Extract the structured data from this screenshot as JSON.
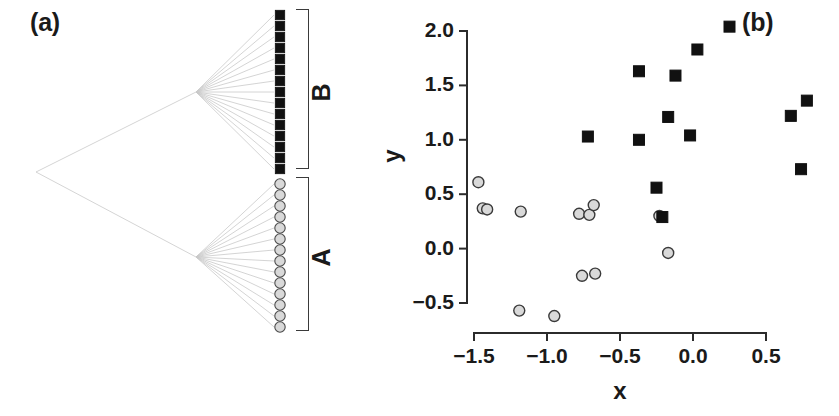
{
  "figure": {
    "width": 839,
    "height": 416,
    "background": "#ffffff"
  },
  "panels": {
    "a": {
      "label": "(a)",
      "description": "phylogenetic-tree",
      "clades": [
        {
          "name": "B",
          "tip_symbol": "filled-square",
          "tip_count": 15,
          "color": "#111111"
        },
        {
          "name": "A",
          "tip_symbol": "open-circle",
          "tip_count": 14,
          "color": "#d9d9d9"
        }
      ],
      "tree_color": "#c9c9c9"
    },
    "b": {
      "label": "(b)"
    }
  },
  "chart_data": {
    "type": "scatter",
    "title": "",
    "xlabel": "x",
    "ylabel": "y",
    "xlim": [
      -1.6,
      0.9
    ],
    "ylim": [
      -0.72,
      2.12
    ],
    "xticks": [
      -1.5,
      -1.0,
      -0.5,
      0.0,
      0.5
    ],
    "xticklabels": [
      "−1.5",
      "−1.0",
      "−0.5",
      "0.0",
      "0.5"
    ],
    "yticks": [
      -0.5,
      0.0,
      0.5,
      1.0,
      1.5,
      2.0
    ],
    "yticklabels": [
      "−0.5",
      "0.0",
      "0.5",
      "1.0",
      "1.5",
      "2.0"
    ],
    "grid": false,
    "legend": "none",
    "series": [
      {
        "name": "A",
        "marker": "circle",
        "fill": "#d9d9d9",
        "edge": "#3a3a3a",
        "size": 11,
        "points": [
          [
            -1.47,
            0.61
          ],
          [
            -1.44,
            0.37
          ],
          [
            -1.41,
            0.36
          ],
          [
            -1.18,
            0.34
          ],
          [
            -0.78,
            0.32
          ],
          [
            -0.71,
            0.31
          ],
          [
            -0.68,
            0.4
          ],
          [
            -0.76,
            -0.25
          ],
          [
            -0.67,
            -0.23
          ],
          [
            -1.19,
            -0.57
          ],
          [
            -0.95,
            -0.62
          ],
          [
            -0.23,
            0.3
          ],
          [
            -0.17,
            -0.04
          ]
        ]
      },
      {
        "name": "B",
        "marker": "square",
        "fill": "#111111",
        "edge": "#111111",
        "size": 11,
        "points": [
          [
            0.25,
            2.04
          ],
          [
            0.03,
            1.83
          ],
          [
            -0.37,
            1.63
          ],
          [
            -0.12,
            1.59
          ],
          [
            0.78,
            1.36
          ],
          [
            -0.17,
            1.21
          ],
          [
            0.67,
            1.22
          ],
          [
            -0.02,
            1.04
          ],
          [
            -0.72,
            1.03
          ],
          [
            -0.37,
            1.0
          ],
          [
            0.74,
            0.73
          ],
          [
            -0.25,
            0.56
          ],
          [
            -0.21,
            0.29
          ]
        ]
      }
    ]
  }
}
